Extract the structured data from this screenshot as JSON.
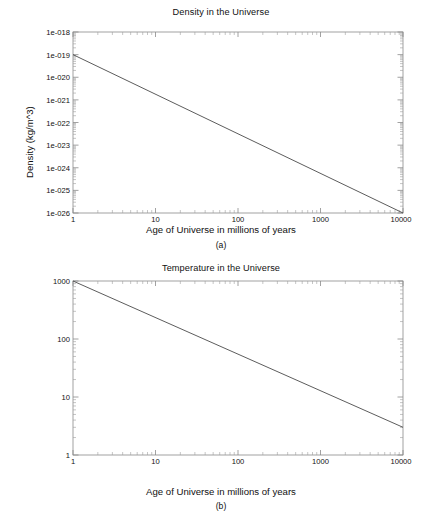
{
  "figures": [
    {
      "id": "a",
      "caption": "(a)",
      "chart_data": {
        "type": "line",
        "title": "Density in the Universe",
        "xlabel": "Age of Universe in millions of years",
        "ylabel": "Density (kg/m^3)",
        "xscale": "log",
        "yscale": "log",
        "xlim": [
          1,
          10000
        ],
        "ylim": [
          1e-26,
          1e-18
        ],
        "grid": false,
        "legend": null,
        "xticks": [
          1,
          10,
          100,
          1000,
          10000
        ],
        "xticklabels": [
          "1",
          "10",
          "100",
          "1000",
          "10000"
        ],
        "yticks": [
          1e-18,
          1e-19,
          1e-20,
          1e-21,
          1e-22,
          1e-23,
          1e-24,
          1e-25,
          1e-26
        ],
        "yticklabels": [
          "1e-018",
          "1e-019",
          "1e-020",
          "1e-021",
          "1e-022",
          "1e-023",
          "1e-024",
          "1e-025",
          "1e-026"
        ],
        "series": [
          {
            "name": "density",
            "x": [
              1,
              10,
              100,
              1000,
              10000
            ],
            "y": [
              1e-19,
              1.78e-21,
              3.16e-23,
              5.62e-25,
              1e-26
            ]
          }
        ]
      }
    },
    {
      "id": "b",
      "caption": "(b)",
      "chart_data": {
        "type": "line",
        "title": "Temperature in the Universe",
        "xlabel": "Age of Universe in millions of years",
        "ylabel": "Temperature (K)",
        "xscale": "log",
        "yscale": "log",
        "xlim": [
          1,
          10000
        ],
        "ylim": [
          1,
          1000
        ],
        "grid": false,
        "legend": null,
        "xticks": [
          1,
          10,
          100,
          1000,
          10000
        ],
        "xticklabels": [
          "1",
          "10",
          "100",
          "1000",
          "10000"
        ],
        "yticks": [
          1000,
          100,
          10,
          1
        ],
        "yticklabels": [
          "1000",
          "100",
          "10",
          "1"
        ],
        "series": [
          {
            "name": "temperature",
            "x": [
              1,
              10,
              100,
              1000,
              10000
            ],
            "y": [
              1000,
              234,
              54.8,
              12.8,
              3.0
            ]
          }
        ]
      }
    }
  ]
}
